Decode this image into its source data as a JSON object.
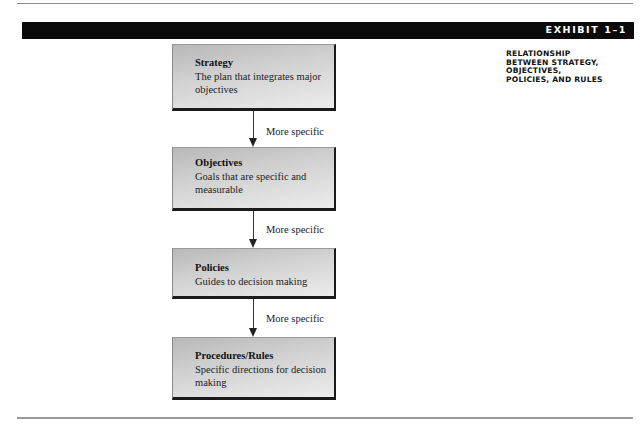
{
  "exhibit": {
    "label": "EXHIBIT 1–1",
    "caption_lines": [
      "RELATIONSHIP",
      "BETWEEN STRATEGY,",
      "OBJECTIVES,",
      "POLICIES, AND RULES"
    ]
  },
  "diagram": {
    "nodes": [
      {
        "title": "Strategy",
        "description": "The plan that integrates major objectives"
      },
      {
        "title": "Objectives",
        "description": "Goals that are specific and measurable"
      },
      {
        "title": "Policies",
        "description": "Guides to decision making"
      },
      {
        "title": "Procedures/Rules",
        "description": "Specific directions for decision making"
      }
    ],
    "edges": [
      {
        "from": "Strategy",
        "to": "Objectives",
        "label": "More specific"
      },
      {
        "from": "Objectives",
        "to": "Policies",
        "label": "More specific"
      },
      {
        "from": "Policies",
        "to": "Procedures/Rules",
        "label": "More specific"
      }
    ]
  }
}
